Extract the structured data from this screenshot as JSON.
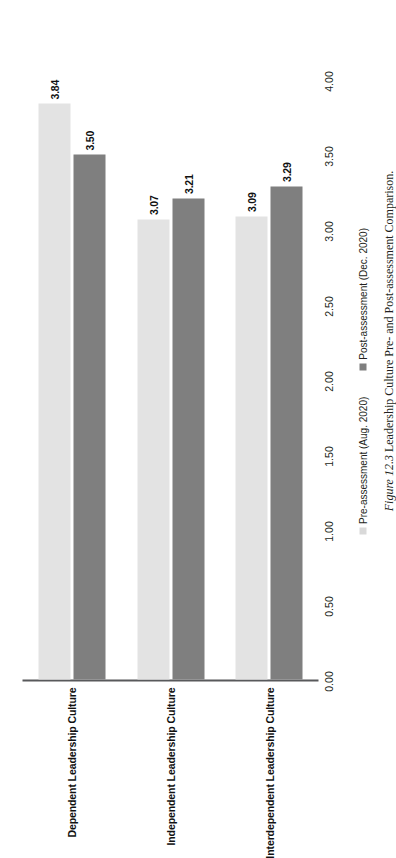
{
  "figure": {
    "caption_label": "Figure 12.3",
    "caption_text": "Leadership Culture Pre- and Post-assessment Comparison."
  },
  "legend": {
    "position": "bottom",
    "items": [
      {
        "label": "Pre-assessment (Aug. 2020)",
        "color": "#d9d9d9",
        "marker": "square-swatch-icon"
      },
      {
        "label": "Post-assessment (Dec. 2020)",
        "color": "#7f7f7f",
        "marker": "square-swatch-icon"
      }
    ]
  },
  "axis": {
    "tick_labels": [
      "0.00",
      "0.50",
      "1.00",
      "1.50",
      "2.00",
      "2.50",
      "3.00",
      "3.50",
      "4.00"
    ],
    "tick_values": [
      0,
      0.5,
      1,
      1.5,
      2,
      2.5,
      3,
      3.5,
      4
    ]
  },
  "categories": [
    {
      "label": "Dependent Leadership Culture"
    },
    {
      "label": "Independent Leadership Culture"
    },
    {
      "label": "Interdependent Leadership Culture"
    }
  ],
  "bars": [
    {
      "category": "Dependent Leadership Culture",
      "series": "Pre-assessment (Aug. 2020)",
      "value": 3.84,
      "value_label": "3.84"
    },
    {
      "category": "Dependent Leadership Culture",
      "series": "Post-assessment (Dec. 2020)",
      "value": 3.5,
      "value_label": "3.50"
    },
    {
      "category": "Independent Leadership Culture",
      "series": "Pre-assessment (Aug. 2020)",
      "value": 3.07,
      "value_label": "3.07"
    },
    {
      "category": "Independent Leadership Culture",
      "series": "Post-assessment (Dec. 2020)",
      "value": 3.21,
      "value_label": "3.21"
    },
    {
      "category": "Interdependent Leadership Culture",
      "series": "Pre-assessment (Aug. 2020)",
      "value": 3.09,
      "value_label": "3.09"
    },
    {
      "category": "Interdependent Leadership Culture",
      "series": "Post-assessment (Dec. 2020)",
      "value": 3.29,
      "value_label": "3.29"
    }
  ],
  "chart_data": {
    "type": "bar",
    "orientation": "horizontal",
    "title": "",
    "xlabel": "",
    "ylabel": "",
    "categories": [
      "Dependent Leadership Culture",
      "Independent Leadership Culture",
      "Interdependent Leadership Culture"
    ],
    "series": [
      {
        "name": "Pre-assessment (Aug. 2020)",
        "values": [
          3.84,
          3.07,
          3.09
        ],
        "color": "#d9d9d9"
      },
      {
        "name": "Post-assessment (Dec. 2020)",
        "values": [
          3.5,
          3.21,
          3.29
        ],
        "color": "#7f7f7f"
      }
    ],
    "value_axis_ticks": [
      0,
      0.5,
      1,
      1.5,
      2,
      2.5,
      3,
      3.5,
      4
    ],
    "value_axis_tick_labels": [
      "0.00",
      "0.50",
      "1.00",
      "1.50",
      "2.00",
      "2.50",
      "3.00",
      "3.50",
      "4.00"
    ],
    "xlim": [
      0,
      4
    ],
    "grid": false,
    "data_labels": true,
    "legend_position": "bottom"
  }
}
